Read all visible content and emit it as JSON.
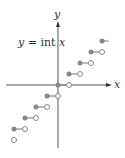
{
  "figure": {
    "title": "y = int x",
    "x_axis_label": "x",
    "y_axis_label": "y",
    "colors": {
      "axis": "#555555",
      "step": "#888888",
      "open_fill": "#ffffff"
    }
  },
  "chart_data": {
    "type": "step",
    "title": "y = int x",
    "xlabel": "x",
    "ylabel": "y",
    "grid": false,
    "segments": [
      {
        "x_start": -4,
        "x_end": -3,
        "y": -4,
        "start": "closed",
        "end": "open"
      },
      {
        "x_start": -3,
        "x_end": -2,
        "y": -3,
        "start": "closed",
        "end": "open"
      },
      {
        "x_start": -2,
        "x_end": -1,
        "y": -2,
        "start": "closed",
        "end": "open"
      },
      {
        "x_start": -1,
        "x_end": 0,
        "y": -1,
        "start": "closed",
        "end": "open"
      },
      {
        "x_start": 0,
        "x_end": 1,
        "y": 0,
        "start": "closed",
        "end": "open"
      },
      {
        "x_start": 1,
        "x_end": 2,
        "y": 1,
        "start": "closed",
        "end": "open"
      },
      {
        "x_start": 2,
        "x_end": 3,
        "y": 2,
        "start": "closed",
        "end": "open"
      },
      {
        "x_start": 3,
        "x_end": 4,
        "y": 3,
        "start": "closed",
        "end": "open"
      },
      {
        "x_start": 4,
        "x_end": 4.5,
        "y": 4,
        "start": "closed",
        "end": "continues"
      }
    ],
    "extra_points": [
      {
        "x": -4,
        "y": -5,
        "type": "open"
      }
    ]
  }
}
